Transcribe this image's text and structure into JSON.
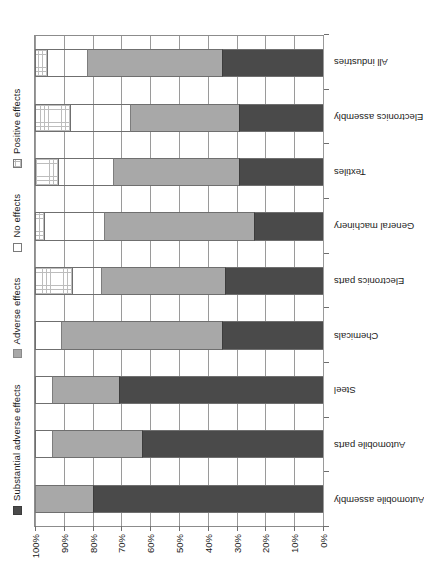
{
  "chart_data": {
    "type": "bar",
    "subtype": "stacked-bar-100-percent",
    "title": "",
    "subtitle": "",
    "xlabel": "",
    "ylabel": "",
    "orientation": "vertical-bars-in-rotated-page",
    "page_rotation": "90-degrees-counterclockwise",
    "grid": true,
    "legend_position": "top",
    "ylim": [
      0,
      100
    ],
    "ytick_labels": [
      "0%",
      "10%",
      "20%",
      "30%",
      "40%",
      "50%",
      "60%",
      "70%",
      "80%",
      "90%",
      "100%"
    ],
    "ytick_values": [
      0,
      10,
      20,
      30,
      40,
      50,
      60,
      70,
      80,
      90,
      100
    ],
    "categories": [
      "Automobile assembly",
      "Automobile parts",
      "Steel",
      "Chemicals",
      "Electronics parts",
      "General machinery",
      "Textiles",
      "Electronics assembly",
      "All industries"
    ],
    "series": [
      {
        "name": "Substantial adverse effects",
        "color": "#4a4a4a",
        "pattern": "solid-dark",
        "values": [
          80,
          63,
          71,
          35,
          34,
          24,
          29,
          29,
          35
        ]
      },
      {
        "name": "Adverse effects",
        "color": "#a8a8a8",
        "pattern": "solid-gray",
        "values": [
          20,
          31,
          23,
          56,
          43,
          52,
          44,
          38,
          47
        ]
      },
      {
        "name": "No effects",
        "color": "#ffffff",
        "pattern": "empty-white",
        "values": [
          0,
          6,
          6,
          9,
          10,
          21,
          19,
          21,
          14
        ]
      },
      {
        "name": "Positive effects",
        "color": "#ffffff",
        "pattern": "grid-hatched",
        "values": [
          0,
          0,
          0,
          0,
          13,
          3,
          8,
          12,
          4
        ]
      }
    ]
  },
  "legend": {
    "items": [
      {
        "label": "Substantial adverse effects",
        "swatch": "sub"
      },
      {
        "label": "Adverse effects",
        "swatch": "adv"
      },
      {
        "label": "No effects",
        "swatch": "no"
      },
      {
        "label": "Positive effects",
        "swatch": "pos"
      }
    ]
  }
}
